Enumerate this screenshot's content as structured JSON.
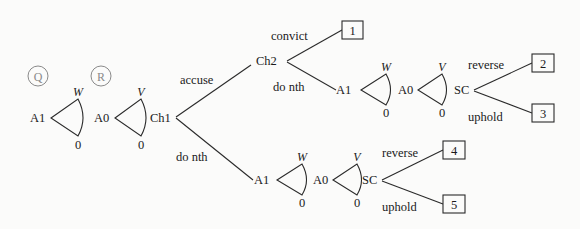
{
  "diagram": {
    "type": "game-tree",
    "markers": [
      {
        "id": "Q",
        "label": "Q"
      },
      {
        "id": "R",
        "label": "R"
      }
    ],
    "nodes": {
      "a1_root": "A1",
      "a0_root": "A0",
      "ch1": "Ch1",
      "ch2": "Ch2",
      "a1_upper": "A1",
      "a0_upper": "A0",
      "sc_upper": "SC",
      "a1_lower": "A1",
      "a0_lower": "A0",
      "sc_lower": "SC"
    },
    "fans": {
      "w_label": "W",
      "v_label": "V",
      "zero_label": "0"
    },
    "edges": {
      "accuse": "accuse",
      "do_nth_ch1": "do nth",
      "convict": "convict",
      "do_nth_ch2": "do nth",
      "reverse_upper": "reverse",
      "uphold_upper": "uphold",
      "reverse_lower": "reverse",
      "uphold_lower": "uphold"
    },
    "outcomes": [
      "1",
      "2",
      "3",
      "4",
      "5"
    ]
  }
}
